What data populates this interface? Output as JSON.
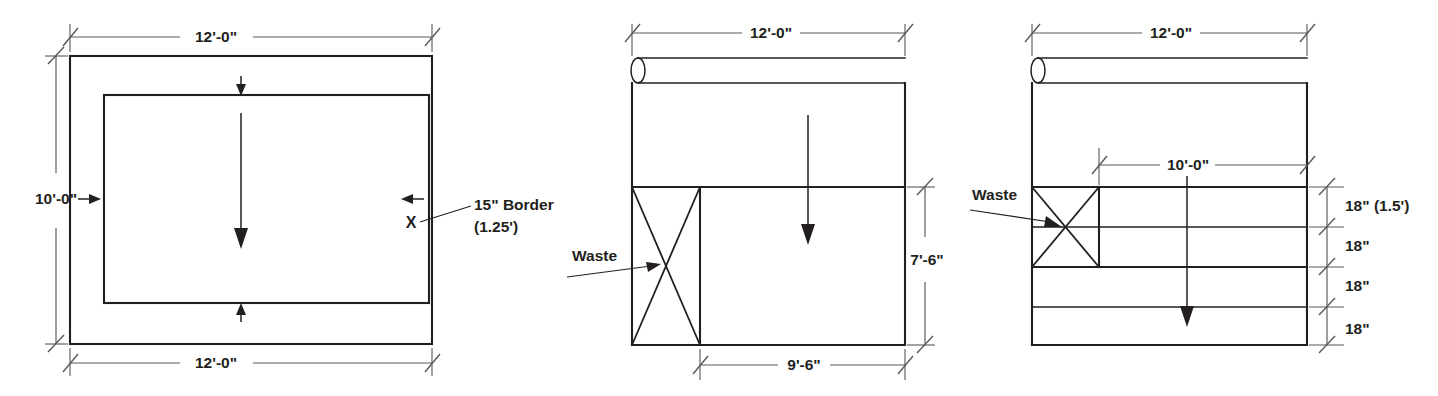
{
  "figure": {
    "ink_color": "#231f20",
    "dim_color": "#58585b",
    "background": "#ffffff"
  },
  "diagrams": [
    {
      "id": "room-with-border",
      "name": "Room with 15 inch border",
      "dimensions": {
        "top_width": "12'-0\"",
        "bottom_width": "12'-0\"",
        "left_height": "10'-0\"",
        "border_label_line1": "15\" Border",
        "border_label_line2": "(1.25')",
        "border_marker": "X"
      }
    },
    {
      "id": "roll-9ft6",
      "name": "Carpet roll cut with waste piece",
      "dimensions": {
        "top_width": "12'-0\"",
        "right_height": "7'-6\"",
        "bottom_width": "9'-6\"",
        "waste_label": "Waste"
      }
    },
    {
      "id": "roll-border-strips",
      "name": "Carpet roll cut into 18 inch border strips",
      "dimensions": {
        "top_width": "12'-0\"",
        "strip_width": "10'-0\"",
        "waste_label": "Waste",
        "strips": [
          "18\" (1.5')",
          "18\"",
          "18\"",
          "18\""
        ]
      }
    }
  ]
}
